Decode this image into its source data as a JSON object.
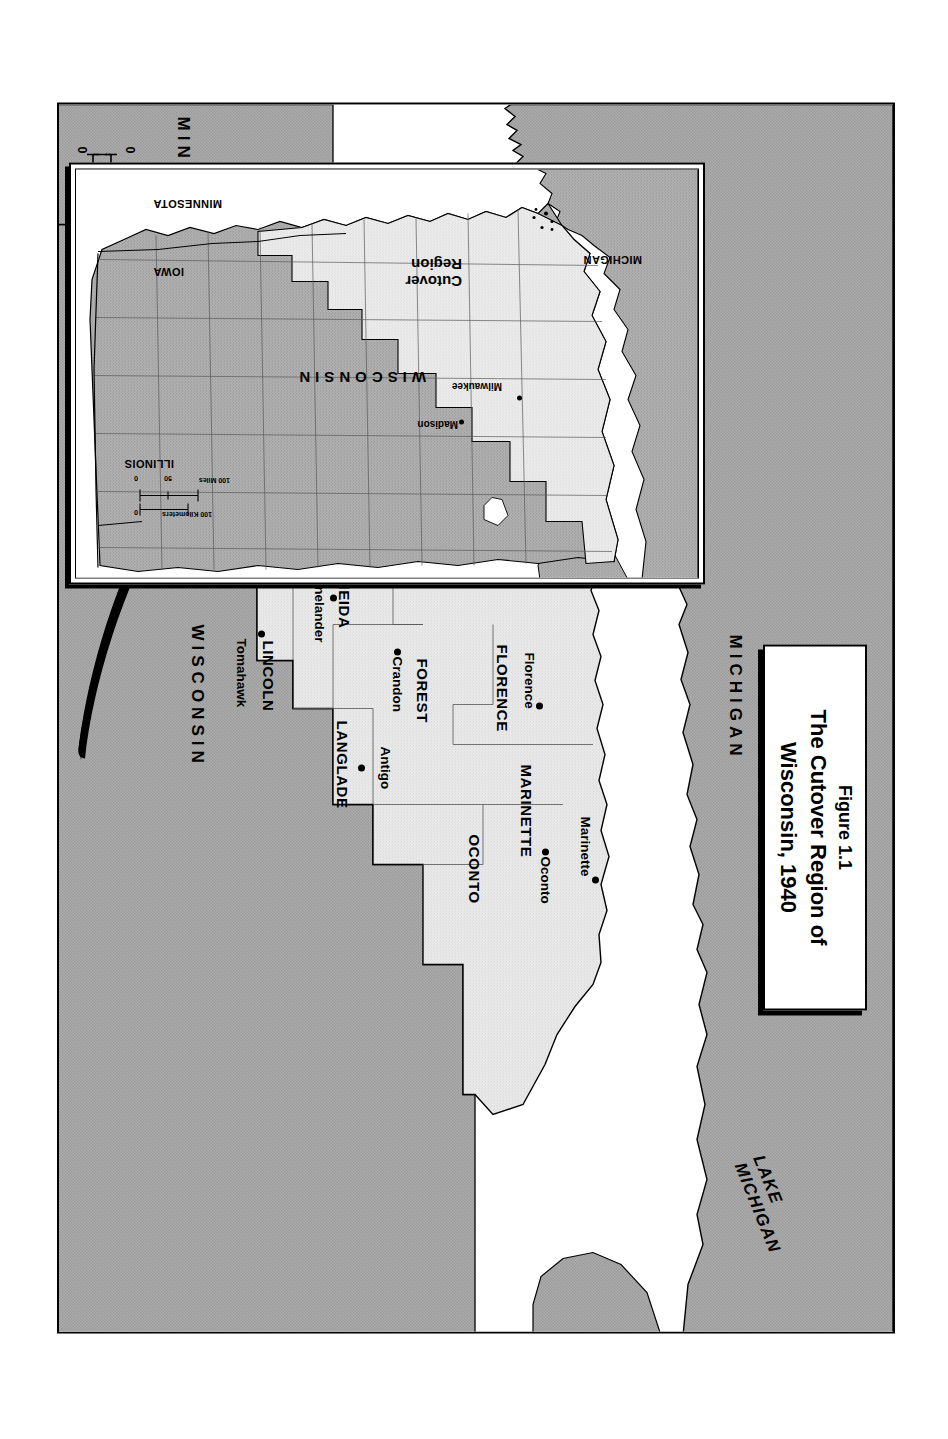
{
  "figure": {
    "number": "Figure 1.1",
    "title": "The Cutover Region of Wisconsin, 1940"
  },
  "main_map": {
    "water_labels": [
      {
        "name": "lake-superior-label",
        "text": "LAKE SUPERIOR"
      },
      {
        "name": "lake-michigan-label",
        "line1": "LAKE",
        "line2": "MICHIGAN"
      }
    ],
    "state_labels": [
      {
        "name": "michigan-label",
        "text": "MICHIGAN"
      },
      {
        "name": "wisconsin-label",
        "text": "WISCONSIN"
      },
      {
        "name": "minnesota-label",
        "text": "MINNESOTA"
      }
    ],
    "counties": [
      {
        "county": "DOUGLAS",
        "city": "Superior"
      },
      {
        "county": "BAYFIELD",
        "city": "Washburn"
      },
      {
        "county": "ASHLAND",
        "city": "Ashland"
      },
      {
        "county": "IRON",
        "city": "Hurley"
      },
      {
        "county": "BURNETT",
        "city": "Grantsburg"
      },
      {
        "county": "WASHBURN",
        "city": "Shell Lake"
      },
      {
        "county": "SAWYER",
        "city": "Hayward"
      },
      {
        "county": "PRICE",
        "city": "Phillips"
      },
      {
        "county": "VILAS",
        "city": "Eagle River"
      },
      {
        "county": "ONEIDA",
        "city": "Rhinelander"
      },
      {
        "county": "FLORENCE",
        "city": "Florence"
      },
      {
        "county": "FOREST",
        "city": "Crandon"
      },
      {
        "county": "MARINETTE",
        "city": "Marinette"
      },
      {
        "county": "OCONTO",
        "city": "Oconto"
      },
      {
        "county": "LANGLADE",
        "city": "Antigo"
      },
      {
        "county": "LINCOLN",
        "city": "Tomahawk"
      },
      {
        "county": "TAYLOR",
        "city": "Medford"
      },
      {
        "county": "RUSK",
        "city": "Ladysmith"
      }
    ],
    "scale": {
      "miles_label": "50 Miles",
      "km_label": "50 Kilometers",
      "zero_top": "0",
      "zero_bottom": "0"
    }
  },
  "inset_map": {
    "region_label_line1": "Cutover",
    "region_label_line2": "Region",
    "states": [
      {
        "name": "michigan",
        "text": "MICHIGAN"
      },
      {
        "name": "minnesota",
        "text": "MINNESOTA"
      },
      {
        "name": "iowa",
        "text": "IOWA"
      },
      {
        "name": "illinois",
        "text": "ILLINOIS"
      },
      {
        "name": "wisconsin",
        "text": "WISCONSIN"
      }
    ],
    "cities": [
      {
        "name": "milwaukee",
        "text": "Milwaukee"
      },
      {
        "name": "madison",
        "text": "Madison"
      }
    ],
    "scale": {
      "miles_label": "100 Miles",
      "km_label": "100 Kilometers",
      "tick_mid": "50",
      "zero_left": "0",
      "zero_right": "0"
    }
  },
  "colors": {
    "cutover_fill": "#ececec",
    "other_state_fill": "#b4b4b4",
    "water_fill": "#ffffff",
    "ink": "#000000"
  }
}
